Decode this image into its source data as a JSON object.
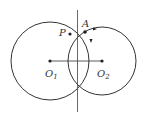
{
  "diagram": {
    "type": "geometry",
    "points": {
      "P": {
        "label": "P",
        "x": 70,
        "y": 34
      },
      "A": {
        "label": "A",
        "x": 85,
        "y": 32
      },
      "O1": {
        "label": "O",
        "sub": "1",
        "x": 50,
        "y": 61
      },
      "O2": {
        "label": "O",
        "sub": "2",
        "x": 102,
        "y": 61
      }
    },
    "circles": [
      {
        "name": "circle-O1",
        "cx": 50,
        "cy": 61,
        "r": 39
      },
      {
        "name": "circle-O2",
        "cx": 102,
        "cy": 61,
        "r": 34
      }
    ],
    "segments": [
      {
        "name": "segment-O1O2",
        "from": "O1",
        "to": "O2"
      }
    ],
    "lines": [
      {
        "name": "vertical-line",
        "x": 77.5,
        "y1": 10,
        "y2": 112
      }
    ],
    "colors": {
      "stroke": "#333333",
      "background": "#ffffff"
    }
  }
}
